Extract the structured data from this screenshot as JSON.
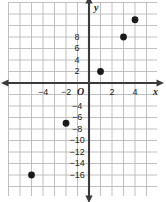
{
  "figure": {
    "kind": "coordinate-plane-scatter",
    "width": 166,
    "height": 202,
    "background_color": "#ffffff",
    "grid_color": "#b9b9bb",
    "axis_color": "#3b3b3e",
    "point_color": "#1a1a1a",
    "text_color": "#231f20"
  },
  "axes": {
    "origin_label": "O",
    "x_axis_name": "x",
    "y_axis_name": "y",
    "x_tick_labels": [
      "-4",
      "-2",
      "2",
      "4"
    ],
    "y_tick_labels": [
      "8",
      "6",
      "4",
      "2",
      "-4",
      "-6",
      "-8",
      "-10",
      "-12",
      "-14",
      "-16"
    ]
  },
  "chart_data": {
    "type": "scatter",
    "title": "",
    "xlabel": "x",
    "ylabel": "y",
    "grid": true,
    "legend": null,
    "xlim": [
      -7,
      6
    ],
    "ylim": [
      -19,
      13
    ],
    "x_tick_step": 2,
    "y_tick_step": 2,
    "x_ticks": [
      -4,
      -2,
      2,
      4
    ],
    "y_ticks": [
      8,
      6,
      4,
      2,
      -4,
      -6,
      -8,
      -10,
      -12,
      -14,
      -16
    ],
    "x": [
      -5,
      -2,
      1,
      3,
      4
    ],
    "y": [
      -16,
      -7,
      2,
      8,
      11
    ],
    "points": [
      {
        "x": -5,
        "y": -16
      },
      {
        "x": -2,
        "y": -7
      },
      {
        "x": 1,
        "y": 2
      },
      {
        "x": 3,
        "y": 8
      },
      {
        "x": 4,
        "y": 11
      }
    ]
  },
  "geometry": {
    "origin_px": {
      "x": 89,
      "y": 83
    },
    "unit_px": {
      "x": 11.5,
      "y": 5.75
    },
    "grid_step_px": 11.5,
    "grid_bounds_px": {
      "left": 8,
      "top": 2,
      "right": 157,
      "bottom": 196
    },
    "point_radius_px": 3.4
  }
}
